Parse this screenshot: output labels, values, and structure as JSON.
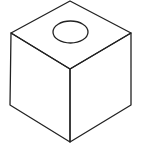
{
  "figure": {
    "stroke_color": "#222222",
    "background": "#ffffff",
    "cube": {
      "top": [
        70,
        1
      ],
      "left": [
        11,
        33
      ],
      "right": [
        131,
        33
      ],
      "front_top": [
        70,
        69
      ],
      "bottom_left": [
        10,
        105
      ],
      "bottom_right": [
        131,
        105
      ],
      "bottom": [
        70,
        142
      ]
    },
    "hole": {
      "cx": 70.5,
      "cy": 32,
      "rx": 17.5,
      "ry": 11
    }
  }
}
